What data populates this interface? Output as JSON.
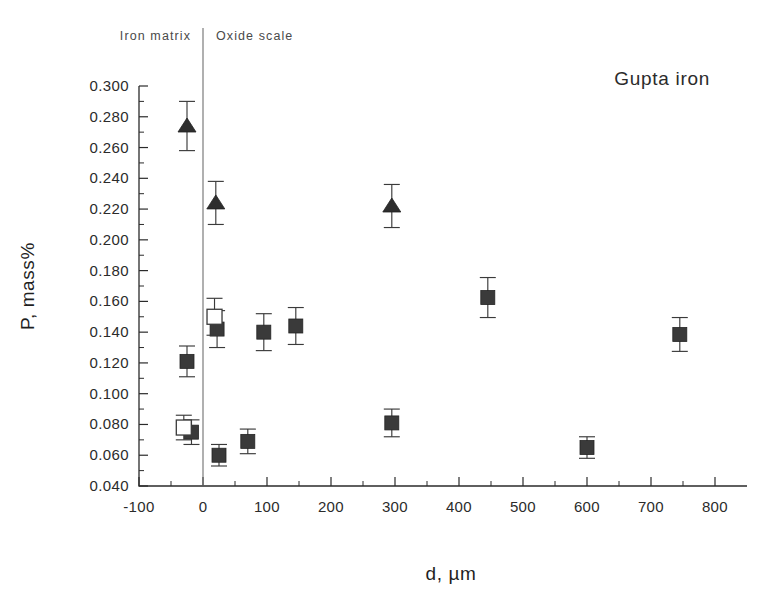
{
  "chart_data": {
    "type": "scatter",
    "title": "",
    "annotation": "Gupta iron",
    "xlabel": "d, µm",
    "ylabel": "P, mass%",
    "xlim": [
      -100,
      850
    ],
    "ylim": [
      0.04,
      0.3
    ],
    "xticks": [
      -100,
      0,
      100,
      200,
      300,
      400,
      500,
      600,
      700,
      800
    ],
    "xticklabels": [
      "-100",
      "0",
      "100",
      "200",
      "300",
      "400",
      "500",
      "600",
      "700",
      "800"
    ],
    "yticks": [
      0.04,
      0.06,
      0.08,
      0.1,
      0.12,
      0.14,
      0.16,
      0.18,
      0.2,
      0.22,
      0.24,
      0.26,
      0.28,
      0.3
    ],
    "yticklabels": [
      "0.040",
      "0.060",
      "0.080",
      "0.100",
      "0.120",
      "0.140",
      "0.160",
      "0.180",
      "0.200",
      "0.220",
      "0.240",
      "0.260",
      "0.280",
      "0.300"
    ],
    "x_minor_ticks": true,
    "y_minor_ticks": true,
    "grid": false,
    "legend": false,
    "region_divider": {
      "x": 0,
      "left_label": "Iron matrix",
      "right_label": "Oxide scale"
    },
    "series": [
      {
        "name": "triangles",
        "marker": "triangle-filled",
        "points": [
          {
            "x": -25,
            "y": 0.274,
            "yerr": 0.016
          },
          {
            "x": 20,
            "y": 0.224,
            "yerr": 0.014
          },
          {
            "x": 295,
            "y": 0.222,
            "yerr": 0.014
          }
        ]
      },
      {
        "name": "filled-squares",
        "marker": "square-filled",
        "points": [
          {
            "x": -25,
            "y": 0.121,
            "yerr": 0.01
          },
          {
            "x": -18,
            "y": 0.075,
            "yerr": 0.008
          },
          {
            "x": 22,
            "y": 0.142,
            "yerr": 0.012
          },
          {
            "x": 25,
            "y": 0.06,
            "yerr": 0.007
          },
          {
            "x": 70,
            "y": 0.069,
            "yerr": 0.008
          },
          {
            "x": 95,
            "y": 0.14,
            "yerr": 0.012
          },
          {
            "x": 145,
            "y": 0.144,
            "yerr": 0.012
          },
          {
            "x": 295,
            "y": 0.081,
            "yerr": 0.009
          },
          {
            "x": 445,
            "y": 0.1625,
            "yerr": 0.013
          },
          {
            "x": 600,
            "y": 0.065,
            "yerr": 0.007
          },
          {
            "x": 745,
            "y": 0.1385,
            "yerr": 0.011
          }
        ]
      },
      {
        "name": "open-squares",
        "marker": "square-open",
        "points": [
          {
            "x": -30,
            "y": 0.078,
            "yerr": 0.008
          },
          {
            "x": 18,
            "y": 0.15,
            "yerr": 0.012
          }
        ]
      }
    ],
    "colors": {
      "marker_fill": "#3a3a3a",
      "marker_open_fill": "#ffffff",
      "axis": "#2b2b2b",
      "background": "#ffffff"
    }
  }
}
